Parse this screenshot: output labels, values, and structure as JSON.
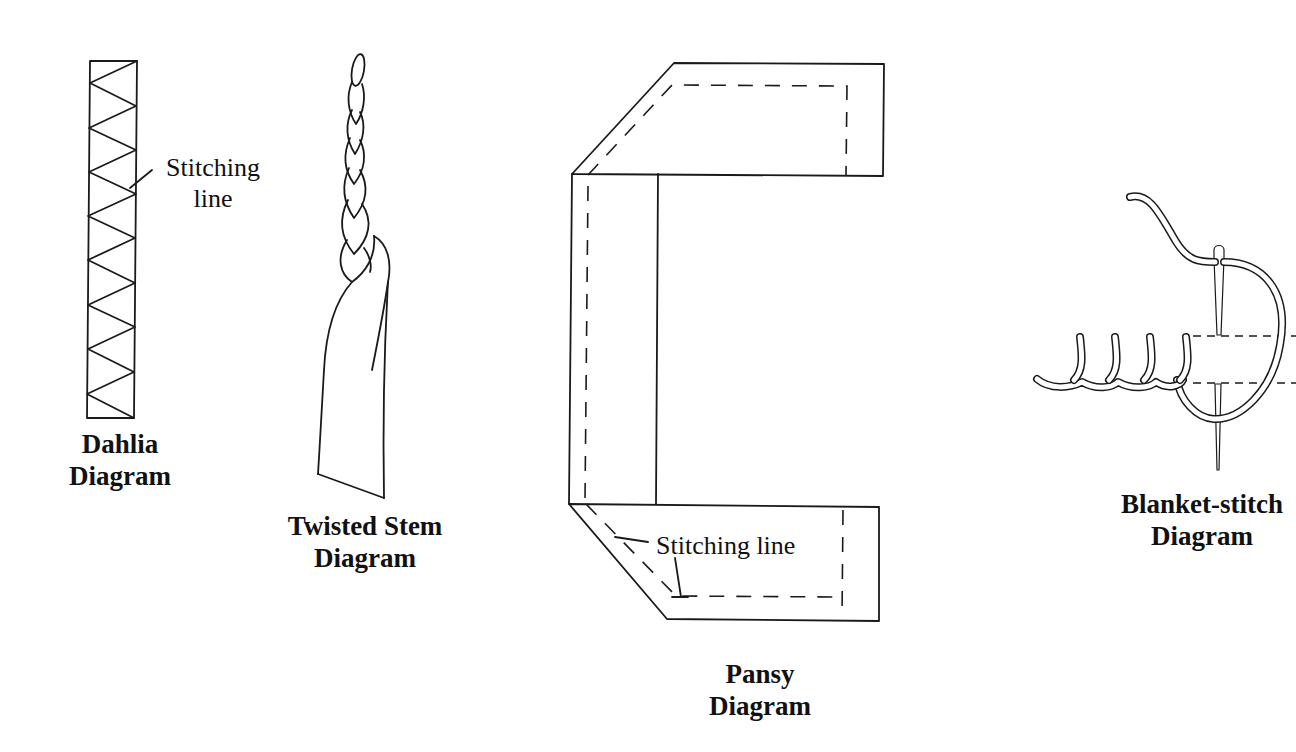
{
  "diagrams": {
    "dahlia": {
      "title_line1": "Dahlia",
      "title_line2": "Diagram",
      "annotation_line1": "Stitching",
      "annotation_line2": "line"
    },
    "twisted_stem": {
      "title_line1": "Twisted Stem",
      "title_line2": "Diagram"
    },
    "pansy": {
      "title_line1": "Pansy",
      "title_line2": "Diagram",
      "annotation": "Stitching line"
    },
    "blanket_stitch": {
      "title_line1": "Blanket-stitch",
      "title_line2": "Diagram"
    }
  },
  "colors": {
    "background": "#ffffff",
    "ink": "#1a1a1a"
  }
}
